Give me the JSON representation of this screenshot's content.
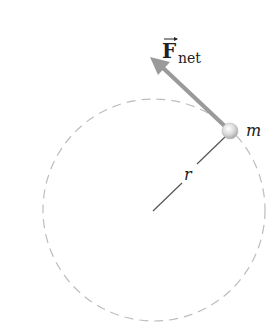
{
  "diagram": {
    "labels": {
      "force_symbol": "F",
      "force_subscript": "net",
      "mass": "m",
      "radius": "r"
    },
    "colors": {
      "circle": "#b8b8b8",
      "arrow": "#9a9a9a",
      "radius_line": "#555555",
      "ball": "#d6d6d6",
      "text": "#222222"
    },
    "geometry": {
      "center": [
        154,
        210
      ],
      "radius": 111,
      "ball": [
        230,
        131
      ],
      "arrow_tip": [
        151,
        58
      ]
    }
  }
}
